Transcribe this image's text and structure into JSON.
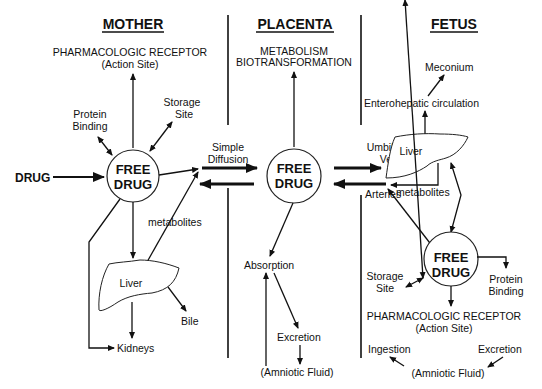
{
  "sections": {
    "mother": "MOTHER",
    "placenta": "PLACENTA",
    "fetus": "FETUS"
  },
  "mother": {
    "receptor_line1": "PHARMACOLOGIC RECEPTOR",
    "receptor_line2": "(Action Site)",
    "protein_binding_line1": "Protein",
    "protein_binding_line2": "Binding",
    "storage_line1": "Storage",
    "storage_line2": "Site",
    "drug": "DRUG",
    "free_drug_line1": "FREE",
    "free_drug_line2": "DRUG",
    "metabolites": "metabolites",
    "liver": "Liver",
    "bile": "Bile",
    "kidneys": "Kidneys"
  },
  "placenta": {
    "metabolism": "METABOLISM",
    "biotransformation": "BIOTRANSFORMATION",
    "simple_line1": "Simple",
    "simple_line2": "Diffusion",
    "free_drug_line1": "FREE",
    "free_drug_line2": "DRUG",
    "absorption": "Absorption",
    "excretion": "Excretion",
    "amniotic": "(Amniotic Fluid)"
  },
  "fetus": {
    "meconium": "Meconium",
    "enterohepatic": "Enterohepatic circulation",
    "umbilical_line1": "Umbilical",
    "umbilical_line2": "Vein",
    "arteries": "Arteries",
    "liver": "Liver",
    "metabolites": "metabolites",
    "free_drug_line1": "FREE",
    "free_drug_line2": "DRUG",
    "storage_line1": "Storage",
    "storage_line2": "Site",
    "protein_binding_line1": "Protein",
    "protein_binding_line2": "Binding",
    "receptor_line1": "PHARMACOLOGIC RECEPTOR",
    "receptor_line2": "(Action Site)",
    "ingestion": "Ingestion",
    "excretion": "Excretion",
    "amniotic": "(Amniotic Fluid)"
  }
}
